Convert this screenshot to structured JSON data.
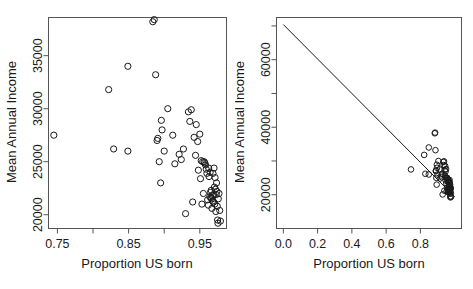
{
  "figure": {
    "title": "",
    "panels": [
      "left",
      "right"
    ]
  },
  "chart_data": [
    {
      "id": "left",
      "type": "scatter",
      "title": "",
      "xlabel": "Proportion US born",
      "ylabel": "Mean Annual Income",
      "xlim": [
        0.7375,
        0.9875
      ],
      "ylim": [
        18700,
        38600
      ],
      "xticks": [
        0.75,
        0.8,
        0.85,
        0.9,
        0.95
      ],
      "xticklabels": [
        "0.75",
        "",
        "0.85",
        "",
        "0.95"
      ],
      "yticks": [
        20000,
        25000,
        30000,
        35000
      ],
      "yticklabels": [
        "20000",
        "25000",
        "30000",
        "35000"
      ],
      "grid": false,
      "legend": "none",
      "marker": "open-circle",
      "x": [
        0.745,
        0.822,
        0.829,
        0.849,
        0.849,
        0.884,
        0.886,
        0.888,
        0.89,
        0.891,
        0.893,
        0.895,
        0.896,
        0.897,
        0.9,
        0.905,
        0.912,
        0.915,
        0.921,
        0.924,
        0.927,
        0.93,
        0.934,
        0.936,
        0.938,
        0.94,
        0.942,
        0.944,
        0.945,
        0.947,
        0.948,
        0.95,
        0.951,
        0.952,
        0.953,
        0.954,
        0.955,
        0.956,
        0.957,
        0.958,
        0.959,
        0.96,
        0.961,
        0.962,
        0.9625,
        0.963,
        0.964,
        0.9645,
        0.965,
        0.9655,
        0.966,
        0.9665,
        0.967,
        0.9675,
        0.968,
        0.9685,
        0.969,
        0.9695,
        0.97,
        0.9705,
        0.971,
        0.9715,
        0.972,
        0.9725,
        0.973,
        0.9735,
        0.974,
        0.9745,
        0.975,
        0.9755,
        0.976,
        0.977,
        0.978,
        0.979
      ],
      "y": [
        27500,
        31800,
        26200,
        34000,
        26000,
        38200,
        38400,
        33200,
        27000,
        27200,
        25000,
        23000,
        28900,
        28000,
        26000,
        30000,
        27500,
        24800,
        25700,
        25200,
        26200,
        20100,
        29700,
        28800,
        29900,
        21200,
        27300,
        25600,
        28500,
        26900,
        24200,
        27600,
        23400,
        25100,
        21000,
        25000,
        22000,
        25000,
        24900,
        24700,
        24300,
        23900,
        21400,
        20900,
        24400,
        23600,
        21700,
        24000,
        22100,
        21600,
        22300,
        21500,
        20600,
        21800,
        21300,
        23900,
        21900,
        21200,
        24400,
        22600,
        21000,
        23500,
        22400,
        20300,
        21900,
        23000,
        22200,
        20800,
        19500,
        19200,
        21500,
        22000,
        20400,
        19400
      ]
    },
    {
      "id": "right",
      "type": "scatter",
      "title": "",
      "xlabel": "Proportion US born",
      "ylabel": "Mean Annual Income",
      "xlim": [
        -0.04,
        1.04
      ],
      "ylim": [
        10000,
        72500
      ],
      "xticks": [
        0.0,
        0.2,
        0.4,
        0.6,
        0.8
      ],
      "xticklabels": [
        "0.0",
        "0.2",
        "0.4",
        "0.6",
        "0.8"
      ],
      "yticks": [
        20000,
        30000,
        40000,
        50000,
        60000,
        70000
      ],
      "yticklabels": [
        "20000",
        "",
        "40000",
        "",
        "60000",
        ""
      ],
      "grid": false,
      "legend": "none",
      "marker": "open-circle",
      "regression_line": {
        "present": true,
        "intercept": 70400,
        "slope": -51000,
        "x_from": 0.0,
        "x_to": 1.0
      },
      "x": [
        0.745,
        0.822,
        0.829,
        0.849,
        0.849,
        0.884,
        0.886,
        0.888,
        0.89,
        0.891,
        0.893,
        0.895,
        0.896,
        0.897,
        0.9,
        0.905,
        0.912,
        0.915,
        0.921,
        0.924,
        0.927,
        0.93,
        0.934,
        0.936,
        0.938,
        0.94,
        0.942,
        0.944,
        0.945,
        0.947,
        0.948,
        0.95,
        0.951,
        0.952,
        0.953,
        0.954,
        0.955,
        0.956,
        0.957,
        0.958,
        0.959,
        0.96,
        0.961,
        0.962,
        0.9625,
        0.963,
        0.964,
        0.9645,
        0.965,
        0.9655,
        0.966,
        0.9665,
        0.967,
        0.9675,
        0.968,
        0.9685,
        0.969,
        0.9695,
        0.97,
        0.9705,
        0.971,
        0.9715,
        0.972,
        0.9725,
        0.973,
        0.9735,
        0.974,
        0.9745,
        0.975,
        0.9755,
        0.976,
        0.977,
        0.978,
        0.979
      ],
      "y": [
        27500,
        31800,
        26200,
        34000,
        26000,
        38200,
        38400,
        33200,
        27000,
        27200,
        25000,
        23000,
        28900,
        28000,
        26000,
        30000,
        27500,
        24800,
        25700,
        25200,
        26200,
        20100,
        29700,
        28800,
        29900,
        21200,
        27300,
        25600,
        28500,
        26900,
        24200,
        27600,
        23400,
        25100,
        21000,
        25000,
        22000,
        25000,
        24900,
        24700,
        24300,
        23900,
        21400,
        20900,
        24400,
        23600,
        21700,
        24000,
        22100,
        21600,
        22300,
        21500,
        20600,
        21800,
        21300,
        23900,
        21900,
        21200,
        24400,
        22600,
        21000,
        23500,
        22400,
        20300,
        21900,
        23000,
        22200,
        20800,
        19500,
        19200,
        21500,
        22000,
        20400,
        19400
      ]
    }
  ]
}
